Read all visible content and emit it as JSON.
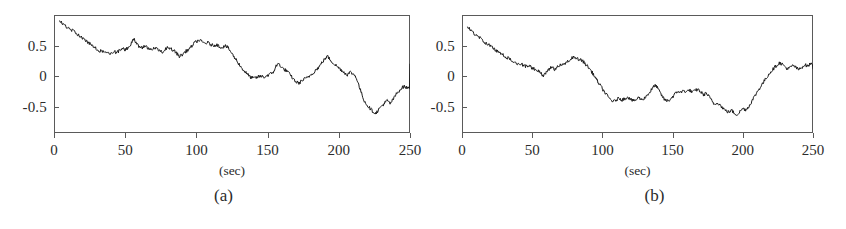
{
  "figure": {
    "type": "two-panel-time-series",
    "background_color": "#ffffff",
    "line_color": "#1c1c1c",
    "frame_color": "#5a5a5a"
  },
  "panels": [
    {
      "caption": "(a)",
      "xlabel": "(sec)",
      "ylabel": "",
      "xticks": [
        "0",
        "50",
        "100",
        "150",
        "200",
        "250"
      ],
      "yticks": [
        "0.5",
        "0",
        "-0.5"
      ]
    },
    {
      "caption": "(b)",
      "xlabel": "(sec)",
      "ylabel": "",
      "xticks": [
        "0",
        "50",
        "100",
        "150",
        "200",
        "250"
      ],
      "yticks": [
        "0.5",
        "0",
        "-0.5"
      ]
    }
  ],
  "chart_data": [
    {
      "type": "line",
      "title": "",
      "subtitle": "",
      "xlabel": "(sec)",
      "ylabel": "",
      "xlim": [
        0,
        250
      ],
      "ylim": [
        -0.92,
        1.0
      ],
      "xticks": [
        0,
        50,
        100,
        150,
        200,
        250
      ],
      "yticks": [
        0.5,
        0,
        -0.5
      ],
      "grid": false,
      "legend": null,
      "annotation": "(a)",
      "series": [
        {
          "name": "signal-a",
          "x": [
            4,
            6,
            8,
            10,
            12,
            14,
            16,
            18,
            20,
            22,
            24,
            26,
            28,
            30,
            32,
            34,
            36,
            38,
            40,
            42,
            44,
            46,
            48,
            50,
            52,
            54,
            56,
            58,
            60,
            62,
            64,
            66,
            68,
            70,
            72,
            74,
            76,
            78,
            80,
            82,
            84,
            86,
            88,
            90,
            92,
            94,
            96,
            98,
            100,
            102,
            104,
            106,
            108,
            110,
            112,
            114,
            116,
            118,
            120,
            122,
            124,
            126,
            128,
            130,
            132,
            134,
            136,
            138,
            140,
            142,
            144,
            146,
            148,
            150,
            152,
            154,
            156,
            158,
            160,
            162,
            164,
            166,
            168,
            170,
            172,
            174,
            176,
            178,
            180,
            182,
            184,
            186,
            188,
            190,
            192,
            194,
            196,
            198,
            200,
            202,
            204,
            206,
            208,
            210,
            212,
            214,
            216,
            218,
            220,
            222,
            224,
            226,
            228,
            230,
            232,
            234,
            236,
            238,
            240,
            242,
            244,
            246,
            248,
            250
          ],
          "values": [
            0.9,
            0.86,
            0.82,
            0.79,
            0.75,
            0.74,
            0.7,
            0.66,
            0.62,
            0.58,
            0.56,
            0.52,
            0.48,
            0.45,
            0.42,
            0.4,
            0.41,
            0.38,
            0.37,
            0.41,
            0.39,
            0.42,
            0.45,
            0.44,
            0.47,
            0.52,
            0.61,
            0.55,
            0.48,
            0.47,
            0.49,
            0.46,
            0.44,
            0.47,
            0.45,
            0.42,
            0.4,
            0.44,
            0.48,
            0.46,
            0.42,
            0.38,
            0.33,
            0.35,
            0.4,
            0.43,
            0.47,
            0.53,
            0.57,
            0.59,
            0.56,
            0.54,
            0.55,
            0.52,
            0.5,
            0.52,
            0.49,
            0.47,
            0.5,
            0.47,
            0.41,
            0.33,
            0.27,
            0.2,
            0.13,
            0.08,
            0.03,
            -0.01,
            -0.03,
            -0.02,
            0.0,
            0.0,
            -0.01,
            0.02,
            0.04,
            0.07,
            0.17,
            0.21,
            0.14,
            0.11,
            0.08,
            0.02,
            -0.04,
            -0.09,
            -0.11,
            -0.07,
            -0.04,
            -0.02,
            0.02,
            0.06,
            0.11,
            0.15,
            0.22,
            0.28,
            0.33,
            0.27,
            0.22,
            0.18,
            0.14,
            0.1,
            0.06,
            0.03,
            0.07,
            0.04,
            0.0,
            -0.14,
            -0.28,
            -0.4,
            -0.47,
            -0.52,
            -0.57,
            -0.6,
            -0.54,
            -0.48,
            -0.44,
            -0.39,
            -0.44,
            -0.38,
            -0.3,
            -0.24,
            -0.19,
            -0.16,
            -0.19,
            -0.17,
            -0.21,
            -0.24,
            -0.22,
            -0.2,
            -0.22,
            -0.24,
            -0.22,
            -0.19,
            -0.21,
            -0.18,
            -0.15,
            -0.18,
            -0.2,
            -0.17,
            -0.13,
            -0.16,
            -0.14,
            -0.1,
            -0.13,
            -0.17,
            -0.12,
            -0.05,
            0.05,
            0.14,
            0.2
          ]
        }
      ]
    },
    {
      "type": "line",
      "title": "",
      "subtitle": "",
      "xlabel": "(sec)",
      "ylabel": "",
      "xlim": [
        0,
        250
      ],
      "ylim": [
        -0.92,
        1.0
      ],
      "xticks": [
        0,
        50,
        100,
        150,
        200,
        250
      ],
      "yticks": [
        0.5,
        0,
        -0.5
      ],
      "grid": false,
      "legend": null,
      "annotation": "(b)",
      "series": [
        {
          "name": "signal-b",
          "x": [
            4,
            6,
            8,
            10,
            12,
            14,
            16,
            18,
            20,
            22,
            24,
            26,
            28,
            30,
            32,
            34,
            36,
            38,
            40,
            42,
            44,
            46,
            48,
            50,
            52,
            54,
            56,
            58,
            60,
            62,
            64,
            66,
            68,
            70,
            72,
            74,
            76,
            78,
            80,
            82,
            84,
            86,
            88,
            90,
            92,
            94,
            96,
            98,
            100,
            102,
            104,
            106,
            108,
            110,
            112,
            114,
            116,
            118,
            120,
            122,
            124,
            126,
            128,
            130,
            132,
            134,
            136,
            138,
            140,
            142,
            144,
            146,
            148,
            150,
            152,
            154,
            156,
            158,
            160,
            162,
            164,
            166,
            168,
            170,
            172,
            174,
            176,
            178,
            180,
            182,
            184,
            186,
            188,
            190,
            192,
            194,
            196,
            198,
            200,
            202,
            204,
            206,
            208,
            210,
            212,
            214,
            216,
            218,
            220,
            222,
            224,
            226,
            228,
            230,
            232,
            234,
            236,
            238,
            240,
            242,
            244,
            246,
            248,
            250
          ],
          "values": [
            0.8,
            0.76,
            0.71,
            0.67,
            0.64,
            0.6,
            0.56,
            0.53,
            0.5,
            0.46,
            0.43,
            0.4,
            0.37,
            0.34,
            0.31,
            0.28,
            0.25,
            0.22,
            0.2,
            0.21,
            0.18,
            0.16,
            0.17,
            0.14,
            0.12,
            0.09,
            0.05,
            0.02,
            0.07,
            0.12,
            0.15,
            0.11,
            0.16,
            0.2,
            0.18,
            0.22,
            0.26,
            0.3,
            0.32,
            0.3,
            0.27,
            0.25,
            0.2,
            0.15,
            0.09,
            0.02,
            -0.06,
            -0.13,
            -0.2,
            -0.27,
            -0.33,
            -0.38,
            -0.41,
            -0.38,
            -0.35,
            -0.38,
            -0.36,
            -0.33,
            -0.37,
            -0.4,
            -0.38,
            -0.34,
            -0.38,
            -0.35,
            -0.3,
            -0.25,
            -0.18,
            -0.14,
            -0.22,
            -0.3,
            -0.37,
            -0.4,
            -0.38,
            -0.33,
            -0.28,
            -0.24,
            -0.26,
            -0.23,
            -0.25,
            -0.22,
            -0.26,
            -0.23,
            -0.21,
            -0.25,
            -0.3,
            -0.27,
            -0.33,
            -0.4,
            -0.46,
            -0.42,
            -0.47,
            -0.52,
            -0.56,
            -0.58,
            -0.55,
            -0.6,
            -0.62,
            -0.57,
            -0.52,
            -0.54,
            -0.5,
            -0.42,
            -0.34,
            -0.26,
            -0.19,
            -0.12,
            -0.05,
            0.02,
            0.08,
            0.13,
            0.18,
            0.22,
            0.2,
            0.16,
            0.12,
            0.15,
            0.18,
            0.14,
            0.11,
            0.15,
            0.19,
            0.17,
            0.2,
            0.22,
            0.19,
            0.15,
            0.1,
            0.05,
            0.0,
            -0.05,
            -0.02,
            0.02,
            0.06,
            0.03,
            0.07,
            0.1,
            0.08,
            0.11,
            0.09,
            0.12,
            0.1,
            0.13,
            0.11,
            0.12
          ]
        }
      ]
    }
  ]
}
